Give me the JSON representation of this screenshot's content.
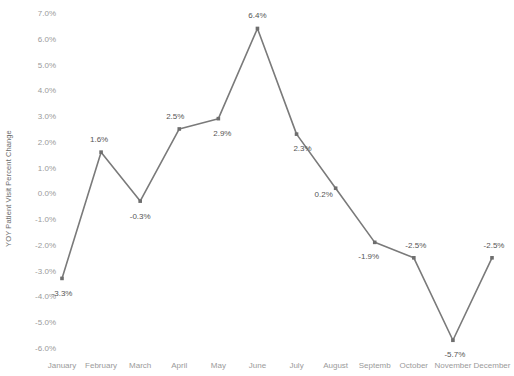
{
  "chart_data": {
    "type": "line",
    "title": "",
    "subtitle": "",
    "xlabel": "",
    "ylabel": "YOY Patient Visit Percent Change",
    "categories": [
      "January",
      "February",
      "March",
      "April",
      "May",
      "June",
      "July",
      "August",
      "Septemb",
      "October",
      "November",
      "December"
    ],
    "categories_full": [
      "January",
      "February",
      "March",
      "April",
      "May",
      "June",
      "July",
      "August",
      "September",
      "October",
      "November",
      "December"
    ],
    "values": [
      -3.3,
      1.6,
      -0.3,
      2.5,
      2.9,
      6.4,
      2.3,
      0.2,
      -1.9,
      -2.5,
      -5.7,
      -2.5
    ],
    "point_labels": [
      "-3.3%",
      "1.6%",
      "-0.3%",
      "2.5%",
      "2.9%",
      "6.4%",
      "2.3%",
      "0.2%",
      "-1.9%",
      "-2.5%",
      "-5.7%",
      "-2.5%"
    ],
    "ylim": [
      -6.0,
      7.0
    ],
    "ytick_values": [
      7.0,
      6.0,
      5.0,
      4.0,
      3.0,
      2.0,
      1.0,
      0.0,
      -1.0,
      -2.0,
      -3.0,
      -4.0,
      -5.0,
      -6.0
    ],
    "ytick_labels": [
      "7.0%",
      "6.0%",
      "5.0%",
      "4.0%",
      "3.0%",
      "2.0%",
      "1.0%",
      "0.0%",
      "-1.0%",
      "-2.0%",
      "-3.0%",
      "-4.0%",
      "-5.0%",
      "-6.0%"
    ],
    "grid": false,
    "legend": false,
    "legend_position": "none",
    "series": [
      {
        "name": "YOY Patient Visit Percent Change",
        "values": [
          -3.3,
          1.6,
          -0.3,
          2.5,
          2.9,
          6.4,
          2.3,
          0.2,
          -1.9,
          -2.5,
          -5.7,
          -2.5
        ],
        "color": "#7a7a7a",
        "marker": "square"
      }
    ],
    "label_offsets": [
      {
        "dx": 0,
        "dy": 15
      },
      {
        "dx": -2,
        "dy": -13
      },
      {
        "dx": 0,
        "dy": 15
      },
      {
        "dx": -4,
        "dy": -13
      },
      {
        "dx": 4,
        "dy": 14
      },
      {
        "dx": 0,
        "dy": -13
      },
      {
        "dx": 6,
        "dy": 14
      },
      {
        "dx": -12,
        "dy": 6
      },
      {
        "dx": -6,
        "dy": 14
      },
      {
        "dx": 2,
        "dy": -13
      },
      {
        "dx": 2,
        "dy": 14
      },
      {
        "dx": 2,
        "dy": -13
      }
    ],
    "colors": {
      "line": "#7a7a7a",
      "marker": "#6e6e6e",
      "point_label_text": "#555555",
      "tick_text": "#9a9a9a",
      "axis_title_text": "#6b6b6b",
      "background": "#ffffff"
    }
  }
}
